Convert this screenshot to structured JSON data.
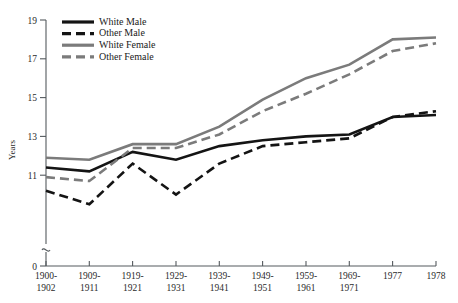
{
  "chart_data": {
    "type": "line",
    "title": "",
    "xlabel": "",
    "ylabel": "Years",
    "ylim": [
      0,
      19
    ],
    "y_ticks": [
      0,
      11,
      13,
      15,
      17,
      19
    ],
    "y_axis_break": true,
    "grid": false,
    "legend_position": "top-left",
    "categories": [
      "1900-\n1902",
      "1909-\n1911",
      "1919-\n1921",
      "1929-\n1931",
      "1939-\n1941",
      "1949-\n1951",
      "1959-\n1961",
      "1969-\n1971",
      "1977",
      "1978"
    ],
    "categories_flat": [
      "1900-1902",
      "1909-1911",
      "1919-1921",
      "1929-1931",
      "1939-1941",
      "1949-1951",
      "1959-1961",
      "1969-1971",
      "1977",
      "1978"
    ],
    "series": [
      {
        "name": "White Male",
        "style": "solid",
        "color": "#141414",
        "values": [
          11.4,
          11.2,
          12.2,
          11.8,
          12.5,
          12.8,
          13.0,
          13.1,
          14.0,
          14.1
        ]
      },
      {
        "name": "Other Male",
        "style": "dashed",
        "color": "#141414",
        "values": [
          10.2,
          9.5,
          11.6,
          10.0,
          11.6,
          12.5,
          12.7,
          12.9,
          14.0,
          14.3
        ]
      },
      {
        "name": "White Female",
        "style": "solid",
        "color": "#7b7b7b",
        "values": [
          11.9,
          11.8,
          12.6,
          12.6,
          13.5,
          14.9,
          16.0,
          16.7,
          18.0,
          18.1
        ]
      },
      {
        "name": "Other Female",
        "style": "dashed",
        "color": "#7b7b7b",
        "values": [
          10.9,
          10.7,
          12.4,
          12.4,
          13.1,
          14.3,
          15.2,
          16.2,
          17.4,
          17.8
        ]
      }
    ]
  },
  "legend": {
    "entries": [
      {
        "label": "White Male"
      },
      {
        "label": "Other Male"
      },
      {
        "label": "White Female"
      },
      {
        "label": "Other Female"
      }
    ]
  },
  "axis": {
    "y_title": "Years",
    "y_tick_labels": [
      "19",
      "17",
      "15",
      "13",
      "11",
      "0"
    ],
    "x_tick_labels_line1": [
      "1900-",
      "1909-",
      "1919-",
      "1929-",
      "1939-",
      "1949-",
      "1959-",
      "1969-",
      "1977",
      "1978"
    ],
    "x_tick_labels_line2": [
      "1902",
      "1911",
      "1921",
      "1931",
      "1941",
      "1951",
      "1961",
      "1971",
      "",
      ""
    ]
  },
  "colors": {
    "black_series": "#141414",
    "gray_series": "#7b7b7b",
    "axis": "#555a5e",
    "background": "#ffffff"
  }
}
